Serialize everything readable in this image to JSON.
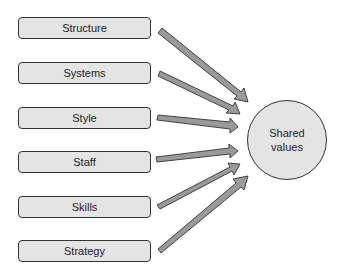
{
  "diagram": {
    "type": "hub-and-spoke",
    "inputs": [
      {
        "label": "Structure",
        "top": 17
      },
      {
        "label": "Systems",
        "top": 62
      },
      {
        "label": "Style",
        "top": 107
      },
      {
        "label": "Staff",
        "top": 151
      },
      {
        "label": "Skills",
        "top": 196
      },
      {
        "label": "Strategy",
        "top": 240
      }
    ],
    "hub": {
      "line1": "Shared",
      "line2": "values"
    },
    "colors": {
      "fill": "#e4e4e4",
      "arrow": "#999999",
      "stroke": "#333333"
    }
  }
}
